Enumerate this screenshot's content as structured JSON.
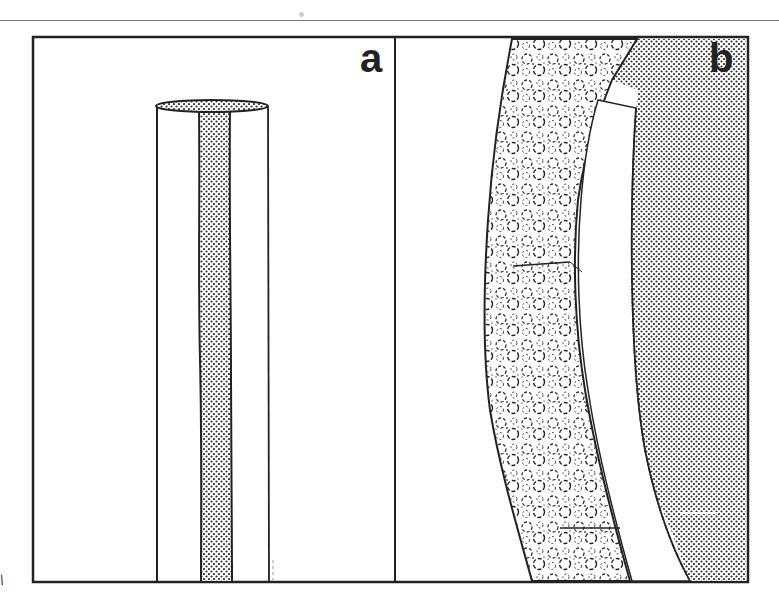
{
  "figure": {
    "panels": [
      {
        "id": "a",
        "label": "a",
        "description": "Cylinder cut open showing a dotted central strip extending from the top surface"
      },
      {
        "id": "b",
        "label": "b",
        "description": "Curved cross-section with cobbled textured band, white band and dotted region"
      }
    ],
    "margin_mark": "/",
    "colors": {
      "ink": "#222222",
      "background": "#ffffff",
      "dot": "#333333",
      "rule": "#777777"
    }
  }
}
